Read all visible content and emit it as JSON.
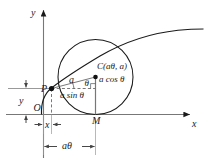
{
  "figure": {
    "type": "geometry-diagram",
    "axes": {
      "y_label": "y",
      "x_label": "x",
      "origin_label": "O"
    },
    "points": {
      "P": "P",
      "C": "C(aθ, a)",
      "M": "M"
    },
    "segments": {
      "radius": "a",
      "vertical_leg": "a cos θ",
      "horizontal_leg": "a sin θ",
      "angle": "θ"
    },
    "dimensions": {
      "height": "y",
      "abscissa": "x",
      "arc": "aθ"
    },
    "colors": {
      "stroke": "#1a1a1a",
      "axis": "#666666",
      "background": "#ffffff"
    }
  }
}
